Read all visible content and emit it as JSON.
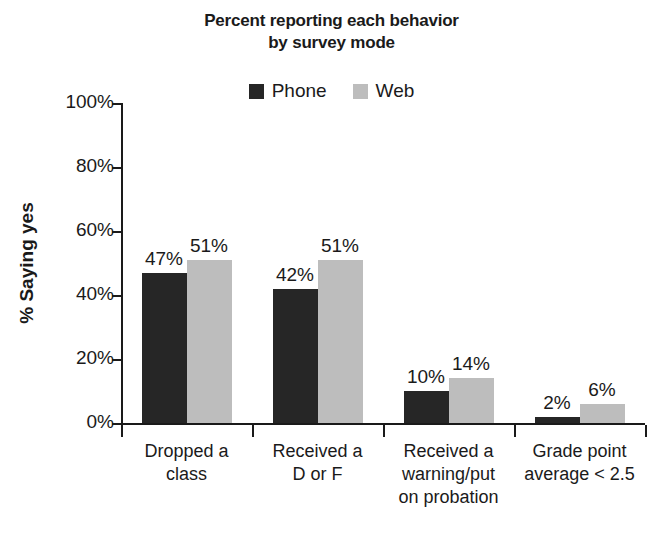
{
  "chart_data": {
    "type": "bar",
    "title": "Percent reporting each behavior by survey mode",
    "title_lines": [
      "Percent reporting each behavior",
      "by survey mode"
    ],
    "xlabel": "",
    "ylabel": "% Saying yes",
    "ylim": [
      0,
      100
    ],
    "yticks": [
      "0%",
      "20%",
      "40%",
      "60%",
      "80%",
      "100%"
    ],
    "ytick_values": [
      0,
      20,
      40,
      60,
      80,
      100
    ],
    "grid": false,
    "legend_position": "top-center",
    "categories": [
      "Dropped a class",
      "Received a D or F",
      "Received a warning/put on probation",
      "Grade point average < 2.5"
    ],
    "category_lines": [
      [
        "Dropped a",
        "class"
      ],
      [
        "Received a",
        "D or F"
      ],
      [
        "Received a",
        "warning/put",
        "on probation"
      ],
      [
        "Grade point",
        "average < 2.5"
      ]
    ],
    "series": [
      {
        "name": "Phone",
        "color": "#262626",
        "values": [
          47,
          42,
          10,
          2
        ],
        "labels": [
          "47%",
          "42%",
          "10%",
          "2%"
        ]
      },
      {
        "name": "Web",
        "color": "#bdbdbd",
        "values": [
          51,
          51,
          14,
          6
        ],
        "labels": [
          "51%",
          "51%",
          "14%",
          "6%"
        ]
      }
    ]
  },
  "colors": {
    "background": "#ffffff",
    "axis": "#1a1a1a",
    "text": "#1a1a1a",
    "phone": "#262626",
    "web": "#bdbdbd"
  }
}
